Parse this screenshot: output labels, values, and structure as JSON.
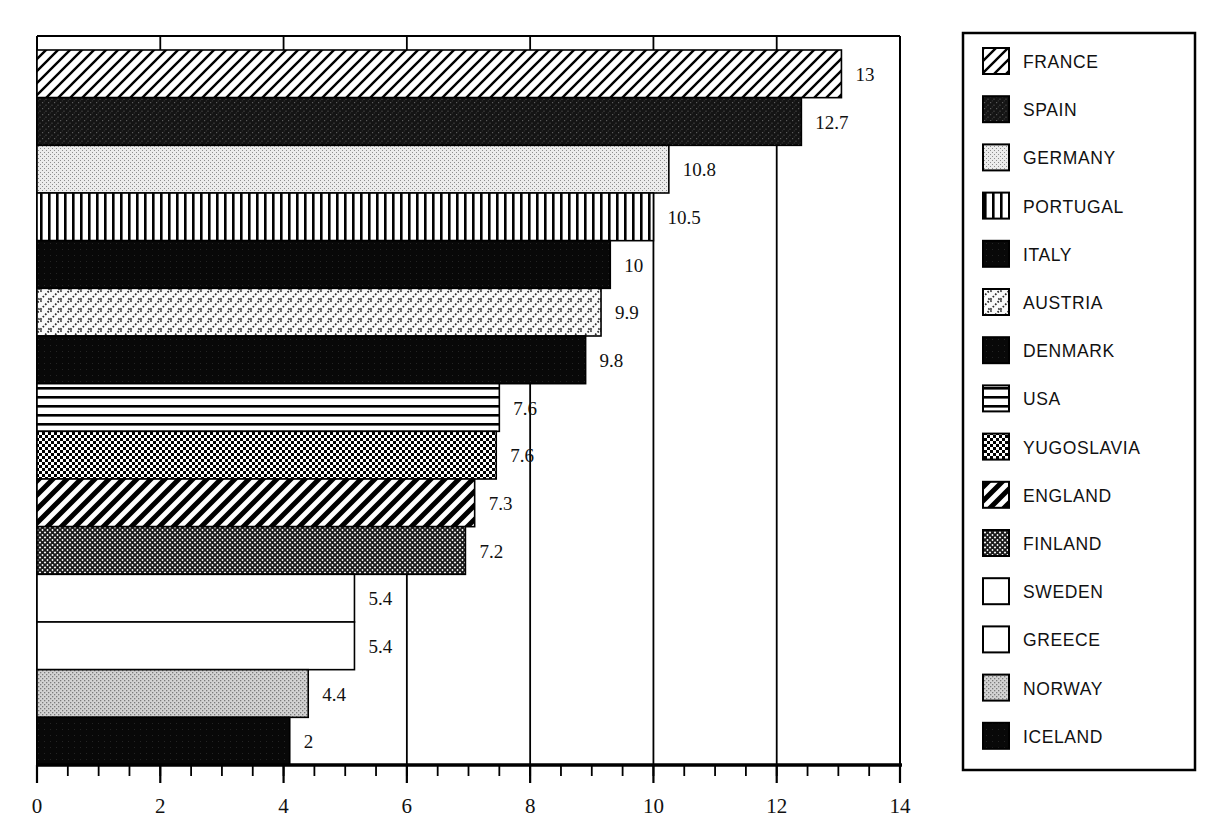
{
  "chart_data": {
    "type": "bar",
    "orientation": "horizontal",
    "title": "",
    "subtitle": "",
    "xlabel": "",
    "ylabel": "",
    "xlim": [
      0,
      14
    ],
    "xticks": [
      0,
      2,
      4,
      6,
      8,
      10,
      12,
      14
    ],
    "xtick_labels": [
      "0",
      "2",
      "4",
      "6",
      "8",
      "10",
      "12",
      "14"
    ],
    "minor_tick_step": 0.5,
    "grid": true,
    "grid_axis": "x",
    "legend_position": "right",
    "categories": [
      "FRANCE",
      "SPAIN",
      "GERMANY",
      "PORTUGAL",
      "ITALY",
      "AUSTRIA",
      "DENMARK",
      "USA",
      "YUGOSLAVIA",
      "ENGLAND",
      "FINLAND",
      "SWEDEN",
      "GREECE",
      "NORWAY",
      "ICELAND"
    ],
    "values": [
      13,
      12.7,
      10.8,
      10.5,
      10,
      9.9,
      9.8,
      7.6,
      7.6,
      7.3,
      7.2,
      5.4,
      5.4,
      4.4,
      2
    ],
    "value_labels": [
      "13",
      "12.7",
      "10.8",
      "10.5",
      "10",
      "9.9",
      "9.8",
      "7.6",
      "7.6",
      "7.3",
      "7.2",
      "5.4",
      "5.4",
      "4.4",
      "2"
    ],
    "bar_extents": [
      13.05,
      12.4,
      10.25,
      10.0,
      9.3,
      9.15,
      8.9,
      7.5,
      7.45,
      7.1,
      6.95,
      5.15,
      5.15,
      4.4,
      4.1
    ],
    "series_patterns": [
      "diagonal-hatch-up",
      "dark-speckle",
      "light-dots",
      "vertical-lines",
      "solid-black",
      "dotted-diagonal",
      "solid-black",
      "horizontal-lines",
      "checkerboard",
      "thick-diagonal",
      "fine-crosshatch",
      "white",
      "white",
      "gray-dots",
      "solid-black"
    ],
    "colors": {
      "axis": "#000000",
      "grid": "#000000",
      "text": "#111111",
      "background": "#ffffff"
    }
  },
  "legend": {
    "items": [
      {
        "label": "FRANCE",
        "pattern": "diagonal-hatch-up"
      },
      {
        "label": "SPAIN",
        "pattern": "dark-speckle"
      },
      {
        "label": "GERMANY",
        "pattern": "light-dots"
      },
      {
        "label": "PORTUGAL",
        "pattern": "vertical-lines"
      },
      {
        "label": "ITALY",
        "pattern": "solid-black"
      },
      {
        "label": "AUSTRIA",
        "pattern": "dotted-diagonal"
      },
      {
        "label": "DENMARK",
        "pattern": "solid-black"
      },
      {
        "label": "USA",
        "pattern": "horizontal-lines"
      },
      {
        "label": "YUGOSLAVIA",
        "pattern": "checkerboard"
      },
      {
        "label": "ENGLAND",
        "pattern": "thick-diagonal"
      },
      {
        "label": "FINLAND",
        "pattern": "fine-crosshatch"
      },
      {
        "label": "SWEDEN",
        "pattern": "white"
      },
      {
        "label": "GREECE",
        "pattern": "white"
      },
      {
        "label": "NORWAY",
        "pattern": "gray-dots"
      },
      {
        "label": "ICELAND",
        "pattern": "solid-black"
      }
    ]
  }
}
